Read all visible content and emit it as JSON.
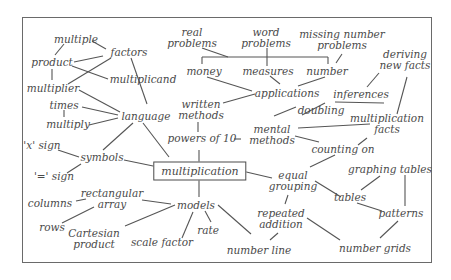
{
  "diagram": {
    "type": "concept-map",
    "central": {
      "id": "multiplication",
      "label": "multiplication"
    },
    "nodes": [
      {
        "id": "multiple",
        "lines": [
          "multiple"
        ]
      },
      {
        "id": "factors",
        "lines": [
          "factors"
        ]
      },
      {
        "id": "product",
        "lines": [
          "product"
        ]
      },
      {
        "id": "multiplicand",
        "lines": [
          "multiplicand"
        ]
      },
      {
        "id": "multiplier",
        "lines": [
          "multiplier"
        ]
      },
      {
        "id": "times",
        "lines": [
          "times"
        ]
      },
      {
        "id": "multiply",
        "lines": [
          "multiply"
        ]
      },
      {
        "id": "language",
        "lines": [
          "language"
        ]
      },
      {
        "id": "x_sign",
        "lines": [
          "'x' sign"
        ]
      },
      {
        "id": "symbols",
        "lines": [
          "symbols"
        ]
      },
      {
        "id": "eq_sign",
        "lines": [
          "'=' sign"
        ]
      },
      {
        "id": "real_problems",
        "lines": [
          "real",
          "problems"
        ]
      },
      {
        "id": "word_problems",
        "lines": [
          "word",
          "problems"
        ]
      },
      {
        "id": "missing_number_problems",
        "lines": [
          "missing number",
          "problems"
        ]
      },
      {
        "id": "money",
        "lines": [
          "money"
        ]
      },
      {
        "id": "measures",
        "lines": [
          "measures"
        ]
      },
      {
        "id": "number",
        "lines": [
          "number"
        ]
      },
      {
        "id": "applications",
        "lines": [
          "applications"
        ]
      },
      {
        "id": "written_methods",
        "lines": [
          "written",
          "methods"
        ]
      },
      {
        "id": "powers_of_10",
        "lines": [
          "powers of 10"
        ]
      },
      {
        "id": "deriving_new_facts",
        "lines": [
          "deriving",
          "new facts"
        ]
      },
      {
        "id": "inferences",
        "lines": [
          "inferences"
        ]
      },
      {
        "id": "doubling",
        "lines": [
          "doubling"
        ]
      },
      {
        "id": "mental_methods",
        "lines": [
          "mental",
          "methods"
        ]
      },
      {
        "id": "multiplication_facts",
        "lines": [
          "multiplication",
          "facts"
        ]
      },
      {
        "id": "counting_on",
        "lines": [
          "counting on"
        ]
      },
      {
        "id": "equal_grouping",
        "lines": [
          "equal",
          "grouping"
        ]
      },
      {
        "id": "graphing_tables",
        "lines": [
          "graphing tables"
        ]
      },
      {
        "id": "tables",
        "lines": [
          "tables"
        ]
      },
      {
        "id": "patterns",
        "lines": [
          "patterns"
        ]
      },
      {
        "id": "repeated_addition",
        "lines": [
          "repeated",
          "addition"
        ]
      },
      {
        "id": "number_grids",
        "lines": [
          "number grids"
        ]
      },
      {
        "id": "number_line",
        "lines": [
          "number line"
        ]
      },
      {
        "id": "columns",
        "lines": [
          "columns"
        ]
      },
      {
        "id": "rectangular_array",
        "lines": [
          "rectangular",
          "array"
        ]
      },
      {
        "id": "rows",
        "lines": [
          "rows"
        ]
      },
      {
        "id": "cartesian_product",
        "lines": [
          "Cartesian",
          "product"
        ]
      },
      {
        "id": "models",
        "lines": [
          "models"
        ]
      },
      {
        "id": "scale_factor",
        "lines": [
          "scale factor"
        ]
      },
      {
        "id": "rate",
        "lines": [
          "rate"
        ]
      }
    ],
    "edges": [
      [
        "multiple",
        "factors"
      ],
      [
        "multiple",
        "product"
      ],
      [
        "product",
        "factors"
      ],
      [
        "product",
        "multiplicand"
      ],
      [
        "product",
        "multiplier"
      ],
      [
        "factors",
        "multiplier"
      ],
      [
        "factors",
        "language"
      ],
      [
        "multiplier",
        "language"
      ],
      [
        "times",
        "language"
      ],
      [
        "times",
        "multiply"
      ],
      [
        "multiply",
        "language"
      ],
      [
        "language",
        "symbols"
      ],
      [
        "language",
        "multiplication"
      ],
      [
        "x_sign",
        "symbols"
      ],
      [
        "eq_sign",
        "symbols"
      ],
      [
        "symbols",
        "multiplication"
      ],
      [
        "real_problems",
        "bracket"
      ],
      [
        "word_problems",
        "bracket"
      ],
      [
        "money",
        "applications"
      ],
      [
        "measures",
        "applications"
      ],
      [
        "number",
        "applications"
      ],
      [
        "missing_number_problems",
        "number"
      ],
      [
        "written_methods",
        "applications"
      ],
      [
        "written_methods",
        "powers_of_10"
      ],
      [
        "powers_of_10",
        "multiplication"
      ],
      [
        "powers_of_10",
        "mental_methods"
      ],
      [
        "doubling",
        "mental_methods"
      ],
      [
        "doubling",
        "inferences"
      ],
      [
        "inferences",
        "deriving_new_facts"
      ],
      [
        "deriving_new_facts",
        "multiplication_facts"
      ],
      [
        "mental_methods",
        "multiplication_facts"
      ],
      [
        "mental_methods",
        "counting_on"
      ],
      [
        "multiplication_facts",
        "counting_on"
      ],
      [
        "counting_on",
        "equal_grouping"
      ],
      [
        "multiplication",
        "equal_grouping"
      ],
      [
        "equal_grouping",
        "tables"
      ],
      [
        "equal_grouping",
        "repeated_addition"
      ],
      [
        "graphing_tables",
        "tables"
      ],
      [
        "graphing_tables",
        "patterns"
      ],
      [
        "tables",
        "patterns"
      ],
      [
        "patterns",
        "number_grids"
      ],
      [
        "repeated_addition",
        "number_grids"
      ],
      [
        "repeated_addition",
        "number_line"
      ],
      [
        "multiplication",
        "models"
      ],
      [
        "models",
        "number_line"
      ],
      [
        "models",
        "rate"
      ],
      [
        "models",
        "scale_factor"
      ],
      [
        "models",
        "cartesian_product"
      ],
      [
        "models",
        "rectangular_array"
      ],
      [
        "columns",
        "rectangular_array"
      ],
      [
        "rows",
        "rectangular_array"
      ]
    ]
  }
}
